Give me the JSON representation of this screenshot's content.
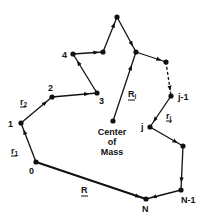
{
  "diagram": {
    "type": "polymer-chain-vector-diagram",
    "nodes": [
      {
        "id": "0",
        "label": "0",
        "x": 36,
        "y": 162
      },
      {
        "id": "1",
        "label": "1",
        "x": 21,
        "y": 123
      },
      {
        "id": "2",
        "label": "2",
        "x": 52,
        "y": 97
      },
      {
        "id": "3",
        "label": "3",
        "x": 97,
        "y": 93
      },
      {
        "id": "4",
        "label": "4",
        "x": 73,
        "y": 54
      },
      {
        "id": "5",
        "label": "",
        "x": 103,
        "y": 52
      },
      {
        "id": "6",
        "label": "",
        "x": 117,
        "y": 17
      },
      {
        "id": "7",
        "label": "",
        "x": 136,
        "y": 52
      },
      {
        "id": "8",
        "label": "",
        "x": 166,
        "y": 62
      },
      {
        "id": "jm1",
        "label": "j-1",
        "x": 171,
        "y": 96
      },
      {
        "id": "j",
        "label": "j",
        "x": 150,
        "y": 127
      },
      {
        "id": "jp1",
        "label": "",
        "x": 183,
        "y": 146
      },
      {
        "id": "Nm1",
        "label": "N-1",
        "x": 181,
        "y": 190
      },
      {
        "id": "N",
        "label": "N",
        "x": 146,
        "y": 199
      },
      {
        "id": "cm",
        "label": "",
        "x": 113,
        "y": 121
      }
    ],
    "labels": {
      "center_of_mass": [
        "Center",
        "of",
        "Mass"
      ],
      "r1": {
        "base": "r",
        "sub": "1"
      },
      "r2": {
        "base": "r",
        "sub": "2"
      },
      "rj": {
        "base": "r",
        "sub": "j"
      },
      "Rl": {
        "base": "R",
        "sub": "l"
      },
      "R": {
        "base": "R"
      }
    },
    "edges": [
      {
        "from": "0",
        "to": "1",
        "style": "solid",
        "name": "bond-vector-r1"
      },
      {
        "from": "1",
        "to": "2",
        "style": "solid",
        "name": "bond-vector-r2"
      },
      {
        "from": "2",
        "to": "3",
        "style": "solid",
        "name": "bond-vector-r3"
      },
      {
        "from": "3",
        "to": "4",
        "style": "solid",
        "name": "bond-vector-r4"
      },
      {
        "from": "4",
        "to": "5",
        "style": "solid",
        "name": "bond-vector-r5"
      },
      {
        "from": "5",
        "to": "6",
        "style": "solid",
        "name": "bond-vector-r6"
      },
      {
        "from": "6",
        "to": "7",
        "style": "solid",
        "name": "bond-vector-r7"
      },
      {
        "from": "7",
        "to": "8",
        "style": "solid",
        "name": "bond-vector-r8"
      },
      {
        "from": "8",
        "to": "jm1",
        "style": "dashed",
        "name": "bond-vector-dashed"
      },
      {
        "from": "jm1",
        "to": "j",
        "style": "solid",
        "name": "bond-vector-rj"
      },
      {
        "from": "j",
        "to": "jp1",
        "style": "solid",
        "name": "bond-vector-rj1"
      },
      {
        "from": "jp1",
        "to": "Nm1",
        "style": "solid",
        "name": "bond-vector-rj2"
      },
      {
        "from": "Nm1",
        "to": "N",
        "style": "solid",
        "name": "bond-vector-rN"
      },
      {
        "from": "0",
        "to": "N",
        "style": "bold",
        "name": "end-to-end-vector-R"
      },
      {
        "from": "cm",
        "to": "7",
        "style": "solid",
        "name": "radius-vector-Rl"
      }
    ]
  }
}
